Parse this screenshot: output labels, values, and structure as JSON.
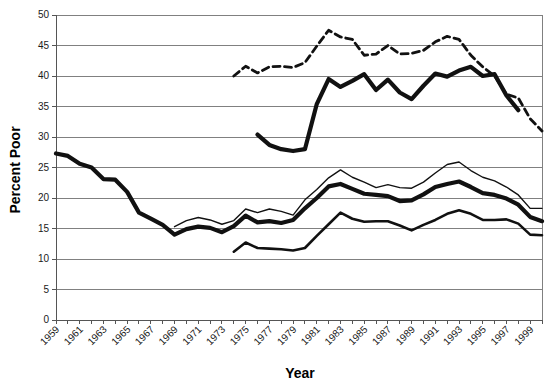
{
  "chart_data": {
    "type": "line",
    "title": "",
    "xlabel": "Year",
    "ylabel": "Percent Poor",
    "xlim": [
      1959,
      2000
    ],
    "ylim": [
      0,
      50
    ],
    "ytick_step": 5,
    "yticks": [
      0,
      5,
      10,
      15,
      20,
      25,
      30,
      35,
      40,
      45,
      50
    ],
    "xticks": [
      1959,
      1960,
      1961,
      1962,
      1963,
      1964,
      1965,
      1966,
      1967,
      1968,
      1969,
      1970,
      1971,
      1972,
      1973,
      1974,
      1975,
      1976,
      1977,
      1978,
      1979,
      1980,
      1981,
      1982,
      1983,
      1984,
      1985,
      1986,
      1987,
      1988,
      1989,
      1990,
      1991,
      1992,
      1993,
      1994,
      1995,
      1996,
      1997,
      1998,
      1999,
      2000
    ],
    "xtick_labels": [
      "1959",
      "1961",
      "1963",
      "1965",
      "1967",
      "1969",
      "1971",
      "1973",
      "1975",
      "1977",
      "1979",
      "1981",
      "1983",
      "1985",
      "1987",
      "1989",
      "1991",
      "1993",
      "1995",
      "1997",
      "1999"
    ],
    "xtick_label_years": [
      1959,
      1961,
      1963,
      1965,
      1967,
      1969,
      1971,
      1973,
      1975,
      1977,
      1979,
      1981,
      1983,
      1985,
      1987,
      1989,
      1991,
      1993,
      1995,
      1997,
      1999
    ],
    "grid": true,
    "grid_axis": "y",
    "legend": "none",
    "line_color": "#111111",
    "grid_color": "#808080",
    "background": "#ffffff",
    "series": [
      {
        "name": "all-children-thick",
        "style": "solid-thick",
        "x": [
          1959,
          1960,
          1961,
          1962,
          1963,
          1964,
          1965,
          1966,
          1967,
          1968,
          1969,
          1970,
          1971,
          1972,
          1973,
          1974,
          1975,
          1976,
          1977,
          1978,
          1979,
          1980,
          1981,
          1982,
          1983,
          1984,
          1985,
          1986,
          1987,
          1988,
          1989,
          1990,
          1991,
          1992,
          1993,
          1994,
          1995,
          1996,
          1997,
          1998,
          1999,
          2000
        ],
        "values": [
          27.3,
          26.9,
          25.6,
          25.0,
          23.1,
          23.0,
          21.0,
          17.6,
          16.6,
          15.6,
          14.0,
          14.9,
          15.3,
          15.1,
          14.4,
          15.4,
          17.1,
          16.0,
          16.2,
          15.9,
          16.4,
          18.3,
          20.0,
          21.9,
          22.3,
          21.5,
          20.7,
          20.5,
          20.3,
          19.5,
          19.6,
          20.6,
          21.8,
          22.3,
          22.7,
          21.8,
          20.8,
          20.5,
          19.9,
          18.9,
          16.9,
          16.2
        ],
        "gaps": []
      },
      {
        "name": "related-children-thin",
        "style": "solid-thin",
        "x": [
          1969,
          1970,
          1971,
          1972,
          1973,
          1974,
          1975,
          1976,
          1977,
          1978,
          1979,
          1980,
          1981,
          1982,
          1983,
          1984,
          1985,
          1986,
          1987,
          1988,
          1989,
          1990,
          1991,
          1992,
          1993,
          1994,
          1995,
          1996,
          1997,
          1998,
          1999,
          2000
        ],
        "values": [
          15.3,
          16.3,
          16.8,
          16.4,
          15.7,
          16.3,
          18.2,
          17.6,
          18.2,
          17.8,
          17.2,
          19.7,
          21.4,
          23.3,
          24.6,
          23.4,
          22.6,
          21.7,
          22.2,
          21.7,
          21.6,
          22.6,
          24.1,
          25.5,
          25.9,
          24.5,
          23.4,
          22.8,
          21.8,
          20.5,
          18.3,
          18.3
        ],
        "gaps": []
      },
      {
        "name": "white-children-lower",
        "style": "solid-mid",
        "x": [
          1974,
          1975,
          1976,
          1977,
          1978,
          1979,
          1980,
          1981,
          1982,
          1983,
          1984,
          1985,
          1986,
          1987,
          1988,
          1989,
          1990,
          1991,
          1992,
          1993,
          1994,
          1995,
          1996,
          1997,
          1998,
          1999,
          2000
        ],
        "values": [
          11.2,
          12.7,
          11.8,
          11.7,
          11.6,
          11.4,
          11.8,
          13.8,
          15.7,
          17.6,
          16.6,
          16.1,
          16.2,
          16.2,
          15.5,
          14.7,
          15.6,
          16.4,
          17.4,
          18.0,
          17.4,
          16.4,
          16.4,
          16.5,
          15.8,
          14.0,
          13.9
        ],
        "gaps": []
      },
      {
        "name": "black-children-dashed",
        "style": "dashed",
        "x": [
          1974,
          1975,
          1976,
          1977,
          1978,
          1979,
          1980,
          1981,
          1982,
          1983,
          1984,
          1985,
          1986,
          1987,
          1988,
          1989,
          1990,
          1991,
          1992,
          1993,
          1994,
          1995,
          1996,
          1997,
          1998,
          1999,
          2000
        ],
        "values": [
          40.0,
          41.6,
          40.5,
          41.5,
          41.6,
          41.4,
          42.2,
          44.9,
          47.5,
          46.4,
          46.0,
          43.4,
          43.6,
          45.0,
          43.6,
          43.7,
          44.2,
          45.6,
          46.5,
          46.0,
          43.4,
          41.5,
          40.0,
          37.0,
          36.4,
          33.0,
          31.0
        ],
        "gaps": []
      },
      {
        "name": "hispanic-children-thickdash",
        "style": "solid-thick-segment",
        "x": [
          1976,
          1977,
          1978,
          1979,
          1980,
          1981,
          1982,
          1983,
          1984,
          1985,
          1986,
          1987,
          1988,
          1989,
          1990,
          1991,
          1992,
          1993,
          1994,
          1995,
          1996,
          1997,
          1998
        ],
        "values": [
          30.4,
          28.7,
          28.0,
          27.7,
          28.0,
          35.4,
          39.5,
          38.2,
          39.2,
          40.3,
          37.7,
          39.4,
          37.3,
          36.2,
          38.4,
          40.4,
          39.9,
          40.9,
          41.5,
          40.0,
          40.3,
          36.8,
          34.4
        ],
        "gaps": []
      }
    ]
  },
  "axis": {
    "y_title": "Percent Poor",
    "x_title": "Year"
  }
}
